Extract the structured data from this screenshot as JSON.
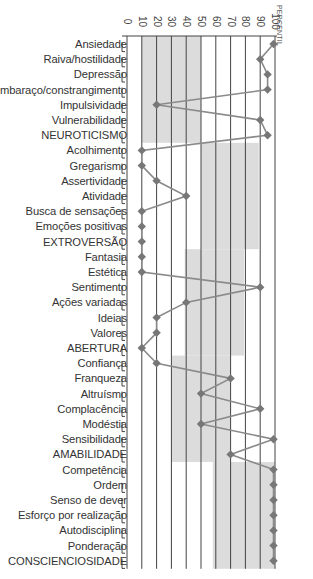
{
  "chart_data": {
    "type": "line",
    "orientation": "horizontal-profile",
    "title": "",
    "xlabel": "PERCENTIL",
    "ylabel": "",
    "xlim": [
      0,
      100
    ],
    "x_ticks": [
      0,
      10,
      20,
      30,
      40,
      50,
      60,
      70,
      80,
      90,
      100
    ],
    "grid": true,
    "legend": null,
    "categories": [
      "Ansiedade",
      "Raiva/hostilidade",
      "Depressão",
      "Embaraço/constrangimento",
      "Impulsividade",
      "Vulnerabilidade",
      "NEUROTICISMO",
      "Acolhimento",
      "Gregarismo",
      "Assertividade",
      "Atividade",
      "Busca de sensações",
      "Emoções positivas",
      "EXTROVERSÃO",
      "Fantasia",
      "Estética",
      "Sentimento",
      "Ações variadas",
      "Ideias",
      "Valores",
      "ABERTURA",
      "Confiança",
      "Franqueza",
      "Altruísmo",
      "Complacência",
      "Modéstia",
      "Sensibilidade",
      "AMABILIDADE",
      "Competência",
      "Ordem",
      "Senso de dever",
      "Esforço por realização",
      "Autodisciplina",
      "Ponderação",
      "CONSCIENCIOSIDADE"
    ],
    "series": [
      {
        "name": "Percentil",
        "values": [
          99,
          90,
          95,
          95,
          20,
          90,
          95,
          10,
          10,
          20,
          40,
          10,
          10,
          10,
          10,
          10,
          90,
          40,
          20,
          20,
          10,
          20,
          70,
          50,
          90,
          50,
          99,
          70,
          99,
          99,
          99,
          99,
          99,
          99,
          99
        ]
      }
    ],
    "reference_bands": [
      {
        "group": "Neuroticismo",
        "from_row": 0,
        "to_row": 6,
        "x_range": [
          10,
          50
        ]
      },
      {
        "group": "Extroversão",
        "from_row": 7,
        "to_row": 13,
        "x_range": [
          50,
          89
        ]
      },
      {
        "group": "Abertura",
        "from_row": 14,
        "to_row": 20,
        "x_range": [
          39,
          79
        ]
      },
      {
        "group": "Amabilidade",
        "from_row": 21,
        "to_row": 27,
        "x_range": [
          30,
          70
        ]
      },
      {
        "group": "Conscienciosidade",
        "from_row": 28,
        "to_row": 34,
        "x_range": [
          58,
          100
        ]
      }
    ]
  },
  "colors": {
    "band": "#dcdcdc",
    "grid": "#444444",
    "marker": "#777777",
    "line": "#8a8a8a",
    "text": "#333333"
  },
  "axis": {
    "unit_label": "PERCENTIL"
  }
}
